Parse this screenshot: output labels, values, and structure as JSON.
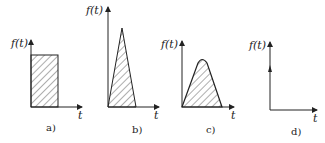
{
  "diagram": {
    "panels": [
      {
        "id": "a",
        "ylabel": "f(t)",
        "xlabel": "t",
        "caption": "a)",
        "shape": "rectangular-pulse"
      },
      {
        "id": "b",
        "ylabel": "f(t)",
        "xlabel": "t",
        "caption": "b)",
        "shape": "triangular-pulse"
      },
      {
        "id": "c",
        "ylabel": "f(t)",
        "xlabel": "t",
        "caption": "c)",
        "shape": "rounded-triangular-pulse"
      },
      {
        "id": "d",
        "ylabel": "f(t)",
        "xlabel": "t",
        "caption": "d)",
        "shape": "impulse"
      }
    ],
    "colors": {
      "ink": "#222222",
      "background": "#ffffff"
    }
  }
}
